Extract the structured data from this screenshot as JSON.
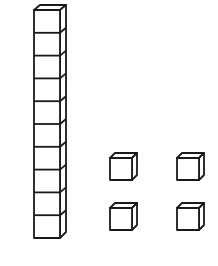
{
  "diagram": {
    "ten_rod": {
      "cube_count": 10,
      "value": 10
    },
    "unit_cubes": {
      "count": 4,
      "value": 4
    },
    "total_value": 14,
    "stroke_color": "#1a1a1a",
    "background": "#ffffff"
  }
}
